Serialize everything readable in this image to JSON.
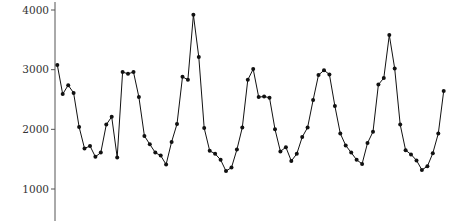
{
  "chart_data": {
    "type": "line",
    "title": "",
    "xlabel": "",
    "ylabel": "",
    "ylim": [
      600,
      4150
    ],
    "yticks": [
      1000,
      2000,
      3000,
      4000
    ],
    "ytick_labels": [
      "1000",
      "2000",
      "3000",
      "4000"
    ],
    "grid": false,
    "legend": null,
    "markers": true,
    "line_color": "#111111",
    "x": [
      1,
      2,
      3,
      4,
      5,
      6,
      7,
      8,
      9,
      10,
      11,
      12,
      13,
      14,
      15,
      16,
      17,
      18,
      19,
      20,
      21,
      22,
      23,
      24,
      25,
      26,
      27,
      28,
      29,
      30,
      31,
      32,
      33,
      34,
      35,
      36,
      37,
      38,
      39,
      40,
      41,
      42,
      43,
      44,
      45,
      46,
      47,
      48,
      49,
      50,
      51,
      52,
      53,
      54,
      55,
      56,
      57,
      58,
      59,
      60,
      61,
      62,
      63,
      64,
      65,
      66,
      67,
      68,
      69,
      70,
      71,
      72
    ],
    "series": [
      {
        "name": "series",
        "values": [
          3080,
          2590,
          2740,
          2610,
          2040,
          1680,
          1720,
          1540,
          1610,
          2080,
          2210,
          1530,
          2960,
          2930,
          2960,
          2540,
          1890,
          1750,
          1610,
          1560,
          1410,
          1790,
          2090,
          2880,
          2830,
          3920,
          3210,
          2020,
          1640,
          1590,
          1490,
          1300,
          1360,
          1660,
          2030,
          2830,
          3010,
          2540,
          2550,
          2530,
          2000,
          1630,
          1700,
          1470,
          1590,
          1870,
          2030,
          2490,
          2910,
          2990,
          2920,
          2390,
          1930,
          1730,
          1610,
          1490,
          1420,
          1770,
          1960,
          2750,
          2860,
          3580,
          3020,
          2080,
          1650,
          1580,
          1480,
          1320,
          1380,
          1600,
          1930,
          2640
        ]
      }
    ]
  }
}
